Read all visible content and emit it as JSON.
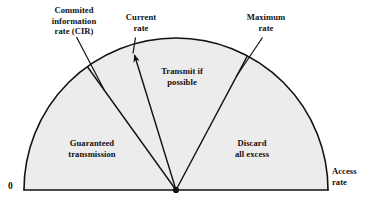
{
  "figure": {
    "type": "fan-sector-diagram",
    "fill_color": "#ececec",
    "stroke_color": "#111111",
    "background_color": "#ffffff"
  },
  "labels": {
    "cir": "Commited\ninformation\nrate (CIR)",
    "current_rate": "Current\nrate",
    "maximum_rate": "Maximum\nrate",
    "transmit": "Transmit if\npossible",
    "guaranteed": "Guaranteed\ntransmission",
    "discard": "Discard\nall excess",
    "access_rate": "Access\nrate",
    "origin": "0"
  },
  "geometry": {
    "center_x": 176,
    "center_y": 190,
    "radius": 152,
    "baseline_y": 190,
    "left_end_x": 24,
    "right_end_x": 328,
    "cir_boundary_angle_deg": 126,
    "current_rate_angle_deg": 108,
    "maximum_rate_angle_deg": 62
  },
  "regions": [
    {
      "name": "guaranteed-transmission",
      "label": "Guaranteed\ntransmission"
    },
    {
      "name": "transmit-if-possible",
      "label": "Transmit if\npossible"
    },
    {
      "name": "discard-all-excess",
      "label": "Discard\nall excess"
    }
  ],
  "annotations": [
    {
      "name": "cir-leader",
      "label": "Commited information rate (CIR)",
      "has_arrowhead": false
    },
    {
      "name": "current-rate-arrow",
      "label": "Current rate",
      "has_arrowhead": true
    },
    {
      "name": "maximum-rate-leader",
      "label": "Maximum rate",
      "has_arrowhead": false
    },
    {
      "name": "access-rate-label",
      "label": "Access rate",
      "has_arrowhead": false
    },
    {
      "name": "origin-label",
      "label": "0",
      "has_arrowhead": false
    }
  ]
}
